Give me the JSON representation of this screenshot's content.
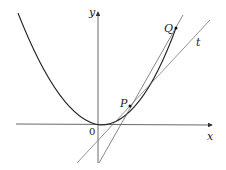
{
  "diagram": {
    "type": "tangent-secant-on-parabola",
    "labels": {
      "y_axis": "y",
      "x_axis": "x",
      "origin": "0",
      "point_p": "P",
      "point_q": "Q",
      "tangent": "t"
    },
    "colors": {
      "curve": "#222222",
      "axes": "#333333",
      "lines": "#555555",
      "background": "#ffffff"
    }
  }
}
